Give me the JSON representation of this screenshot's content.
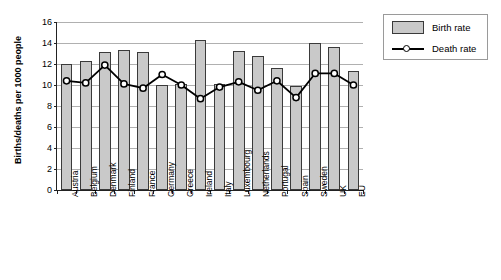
{
  "chart_data": {
    "type": "bar",
    "title": "",
    "xlabel": "",
    "ylabel": "Births/deaths per 1000 people",
    "ylim": [
      0,
      16
    ],
    "ytick_step": 2,
    "yticks": [
      0,
      2,
      4,
      6,
      8,
      10,
      12,
      14,
      16
    ],
    "grid": true,
    "legend_position": "right",
    "categories": [
      "Austria",
      "Belgium",
      "Denmark",
      "Finland",
      "France",
      "Germany",
      "Greece",
      "Ireland",
      "Italy",
      "Luxembourg",
      "Netherlands",
      "Portugal",
      "Spain",
      "Sweden",
      "UK",
      "EU"
    ],
    "series": [
      {
        "name": "Birth rate",
        "type": "bar",
        "color": "#c9c9c9",
        "values": [
          12.0,
          12.3,
          13.1,
          13.3,
          13.1,
          10.0,
          10.1,
          14.3,
          10.1,
          13.2,
          12.8,
          11.6,
          9.9,
          14.0,
          13.6,
          11.3
        ]
      },
      {
        "name": "Death rate",
        "type": "line",
        "color": "#000000",
        "values": [
          10.4,
          10.2,
          11.9,
          10.1,
          9.7,
          11.0,
          10.0,
          8.7,
          9.8,
          10.3,
          9.5,
          10.4,
          8.8,
          11.1,
          11.1,
          10.0
        ]
      }
    ]
  },
  "legend": {
    "items": [
      {
        "label": "Birth rate"
      },
      {
        "label": "Death rate"
      }
    ]
  }
}
